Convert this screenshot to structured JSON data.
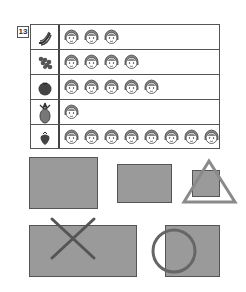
{
  "question_number": "13",
  "chart_data": {
    "type": "table",
    "title": "",
    "xlabel": "",
    "ylabel": "",
    "categories": [
      "banana",
      "grapes",
      "tomato",
      "pineapple",
      "strawberry"
    ],
    "values": [
      3,
      4,
      5,
      1,
      8
    ],
    "unit_icon": "child-face-icon",
    "grid": true
  },
  "rows": [
    {
      "fruit": "banana",
      "icon": "banana-icon",
      "count": 3
    },
    {
      "fruit": "grapes",
      "icon": "grapes-icon",
      "count": 4
    },
    {
      "fruit": "tomato",
      "icon": "tomato-icon",
      "count": 5
    },
    {
      "fruit": "pineapple",
      "icon": "pineapple-icon",
      "count": 1
    },
    {
      "fruit": "strawberry",
      "icon": "strawberry-icon",
      "count": 8
    }
  ],
  "annotations": {
    "rect_fill": "#9a9a9a",
    "stroke": "#555555",
    "symbols": [
      "triangle",
      "cross",
      "circle"
    ]
  }
}
